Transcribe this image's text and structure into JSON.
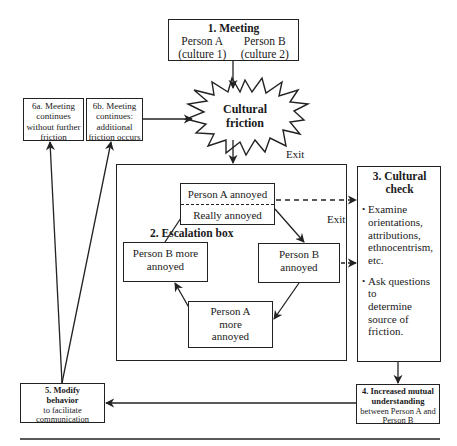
{
  "diagram": {
    "nodes": {
      "meeting": {
        "title": "1. Meeting",
        "person_a": "Person A",
        "person_b": "Person B",
        "culture_a": "(culture 1)",
        "culture_b": "(culture 2)"
      },
      "cultural_friction": {
        "line1": "Cultural",
        "line2": "friction"
      },
      "escalation_box": {
        "title": "2. Escalation box",
        "person_a_annoyed": "Person A annoyed",
        "really_annoyed": "Really annoyed",
        "person_b_annoyed": {
          "line1": "Person B",
          "line2": "annoyed"
        },
        "person_a_more": {
          "line1": "Person A",
          "line2": "more",
          "line3": "annoyed"
        },
        "person_b_more": {
          "line1": "Person B more",
          "line2": "annoyed"
        }
      },
      "cultural_check": {
        "title_line1": "3. Cultural",
        "title_line2": "check",
        "bullets": [
          {
            "lines": [
              "Examine",
              "orientations,",
              "attributions,",
              "ethnocentrism,",
              "etc."
            ]
          },
          {
            "lines": [
              "Ask questions to",
              "determine",
              "source of",
              "friction."
            ]
          }
        ]
      },
      "mutual_understanding": {
        "line1": "4. Increased mutual",
        "line2": "understanding",
        "line3": "between Person A and",
        "line4": "Person B"
      },
      "modify_behavior": {
        "line1": "5. Modify",
        "line2": "behavior",
        "line3": "to facilitate",
        "line4": "communication"
      },
      "meeting_continues_no_friction": {
        "line1": "6a. Meeting",
        "line2": "continues",
        "line3": "without further",
        "line4": "friction"
      },
      "meeting_continues_friction": {
        "line1": "6b. Meeting",
        "line2": "continues:",
        "line3": "additional",
        "line4": "friction occurs"
      }
    },
    "labels": {
      "exit_top": "Exit",
      "exit_right": "Exit"
    },
    "bullet_symbol": "•",
    "colors": {
      "line": "#222222",
      "background": "#ffffff"
    }
  }
}
